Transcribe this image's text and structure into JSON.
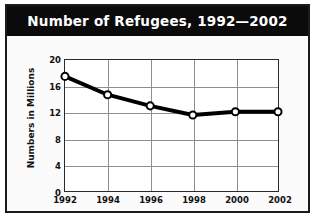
{
  "figure": {
    "title": "Number of Refugees, 1992—2002",
    "title_bar_color": "#0b0b0b",
    "title_text_color": "#ffffff",
    "border_color": "#1b1b1b",
    "background_color": "#fdfdfd"
  },
  "chart_data": {
    "type": "line",
    "title": "Number of Refugees, 1992—2002",
    "xlabel": "",
    "ylabel": "Numbers in Millions",
    "categories": [
      "1992",
      "1994",
      "1996",
      "1998",
      "2000",
      "2002"
    ],
    "values": [
      17.5,
      14.7,
      13.0,
      11.6,
      12.1,
      12.1
    ],
    "x_tick_labels": [
      "1992",
      "1994",
      "1996",
      "1998",
      "2000",
      "2002"
    ],
    "y_tick_labels": [
      "0",
      "4",
      "8",
      "12",
      "16",
      "20"
    ],
    "y_ticks": [
      0,
      4,
      8,
      12,
      16,
      20
    ],
    "ylim": [
      0,
      20
    ],
    "grid": true,
    "grid_color": "#8f8f8f",
    "legend": false,
    "legend_position": "none",
    "series": [
      {
        "name": "Number of Refugees",
        "values": [
          17.5,
          14.7,
          13.0,
          11.6,
          12.1,
          12.1
        ],
        "line_color": "#000000",
        "marker": "circle",
        "marker_fill": "#ffffff",
        "marker_edge_color": "#000000"
      }
    ]
  }
}
